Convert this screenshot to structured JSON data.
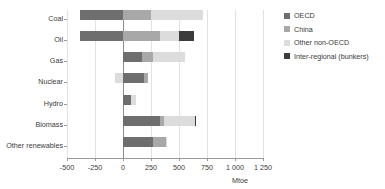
{
  "chart_data": {
    "type": "bar",
    "orientation": "horizontal",
    "stacked": true,
    "title": "",
    "xlabel": "Mtoe",
    "ylabel": "",
    "unit_label": "Mtoe",
    "xlim": [
      -500,
      1250
    ],
    "xticks": [
      -500,
      -250,
      0,
      250,
      500,
      750,
      1000,
      1250
    ],
    "xtick_labels": [
      "-500",
      "-250",
      "0",
      "250",
      "500",
      "750",
      "1 000",
      "1 250"
    ],
    "grid": "vertical",
    "legend_position": "right",
    "categories": [
      "Coal",
      "Oil",
      "Gas",
      "Nuclear",
      "Hydro",
      "Biomass",
      "Other renewables"
    ],
    "series": [
      {
        "name": "OECD",
        "color": "#6e6e6e",
        "values": [
          -380,
          -380,
          170,
          190,
          70,
          330,
          265
        ]
      },
      {
        "name": "China",
        "color": "#a8a8a8",
        "values": [
          250,
          330,
          95,
          30,
          0,
          40,
          115
        ]
      },
      {
        "name": "Other non-OECD",
        "color": "#dcdcdc",
        "values": [
          465,
          170,
          290,
          -70,
          50,
          270,
          5
        ]
      },
      {
        "name": "Inter-regional (bunkers)",
        "color": "#3c3c3c",
        "values": [
          0,
          135,
          0,
          0,
          0,
          15,
          0
        ]
      }
    ],
    "totals_positive": [
      715,
      635,
      555,
      220,
      120,
      655,
      385
    ]
  },
  "legend": {
    "items": [
      {
        "label": "OECD",
        "color": "#6e6e6e"
      },
      {
        "label": "China",
        "color": "#a8a8a8"
      },
      {
        "label": "Other non-OECD",
        "color": "#dcdcdc"
      },
      {
        "label": "Inter-regional (bunkers)",
        "color": "#3c3c3c"
      }
    ]
  },
  "axis": {
    "unit": "Mtoe"
  }
}
